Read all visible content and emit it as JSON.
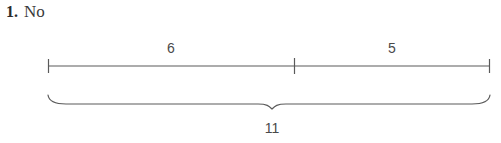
{
  "question": {
    "number": "1.",
    "answer": "No"
  },
  "diagram": {
    "type": "number-bond-line",
    "stroke_color": "#5a5a5a",
    "segments": [
      {
        "label": "6",
        "start_x": 48,
        "end_x": 294,
        "center_x": 171
      },
      {
        "label": "5",
        "start_x": 294,
        "end_x": 490,
        "center_x": 392
      }
    ],
    "ticks": [
      {
        "x": 48,
        "name": "left-endpoint-tick"
      },
      {
        "x": 294,
        "name": "middle-divider-tick"
      },
      {
        "x": 490,
        "name": "right-endpoint-tick"
      }
    ],
    "brace": {
      "label": "11",
      "start_x": 48,
      "end_x": 490,
      "cusp_x": 272
    }
  }
}
